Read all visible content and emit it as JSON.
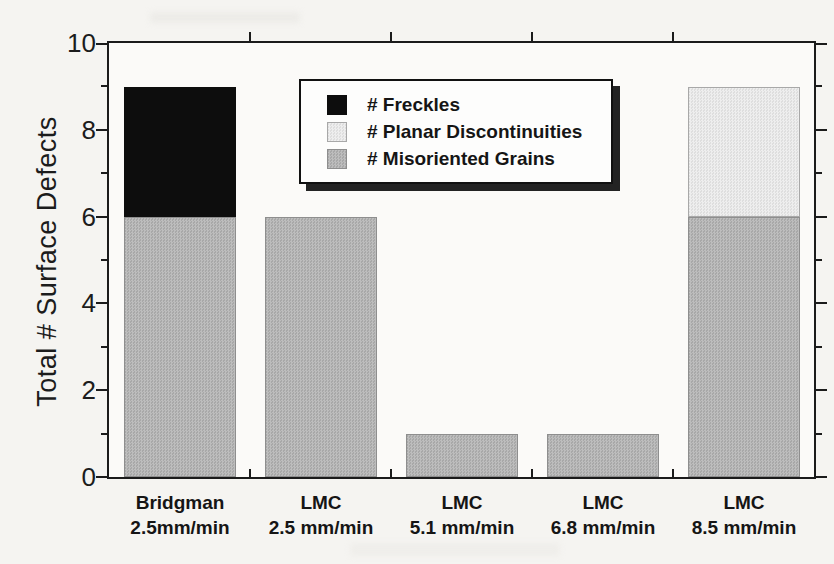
{
  "figure": {
    "background": "#f5f4f1",
    "frame_color": "#1b1b1b"
  },
  "chart_data": {
    "type": "bar",
    "stacked": true,
    "title": "",
    "xlabel": "",
    "ylabel": "Total # Surface Defects",
    "ylim": [
      0,
      10
    ],
    "y_major_ticks": [
      0,
      2,
      4,
      6,
      8,
      10
    ],
    "y_minor_ticks": [
      1,
      3,
      5,
      7,
      9
    ],
    "grid": false,
    "legend_position": "top-center-inside",
    "categories": [
      {
        "line1": "Bridgman",
        "line2": "2.5mm/min"
      },
      {
        "line1": "LMC",
        "line2": "2.5 mm/min"
      },
      {
        "line1": "LMC",
        "line2": "5.1 mm/min"
      },
      {
        "line1": "LMC",
        "line2": "6.8 mm/min"
      },
      {
        "line1": "LMC",
        "line2": "8.5 mm/min"
      }
    ],
    "series": [
      {
        "name": "# Freckles",
        "color": "#0d0d0d",
        "values": [
          3,
          0,
          0,
          0,
          0
        ]
      },
      {
        "name": "# Planar Discontinuities",
        "color": "#e6e6e6",
        "values": [
          0,
          0,
          0,
          0,
          3
        ]
      },
      {
        "name": "# Misoriented Grains",
        "color": "#b4b4b4",
        "values": [
          6,
          6,
          1,
          1,
          6
        ]
      }
    ],
    "stack_order_bottom_to_top": [
      "# Misoriented Grains",
      "# Freckles",
      "# Planar Discontinuities"
    ],
    "totals": [
      9,
      6,
      1,
      1,
      9
    ]
  }
}
